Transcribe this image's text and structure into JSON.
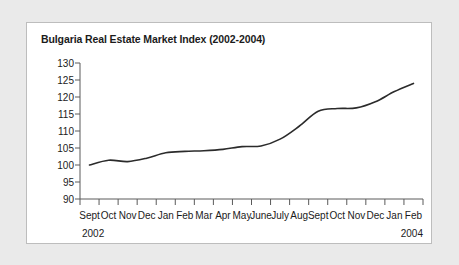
{
  "chart_data": {
    "type": "line",
    "title": "Bulgaria Real Estate Market Index (2002-2004)",
    "xlabel": "",
    "ylabel": "",
    "ylim": [
      90,
      130
    ],
    "yticks": [
      90,
      95,
      100,
      105,
      110,
      115,
      120,
      125,
      130
    ],
    "grid": false,
    "legend": "none",
    "categories": [
      "Sept",
      "Oct",
      "Nov",
      "Dec",
      "Jan",
      "Feb",
      "Mar",
      "Apr",
      "May",
      "June",
      "July",
      "Aug",
      "Sept",
      "Oct",
      "Nov",
      "Dec",
      "Jan",
      "Feb"
    ],
    "values": [
      100.0,
      101.4,
      101.0,
      102.0,
      103.6,
      104.0,
      104.2,
      104.6,
      105.4,
      105.6,
      107.6,
      111.4,
      115.8,
      116.6,
      116.8,
      118.6,
      121.6,
      124.0
    ],
    "start_year": "2002",
    "end_year": "2004"
  },
  "panel": {
    "title": "Bulgaria Real Estate Market Index (2002-2004)"
  },
  "footer": {
    "source_note": ""
  }
}
